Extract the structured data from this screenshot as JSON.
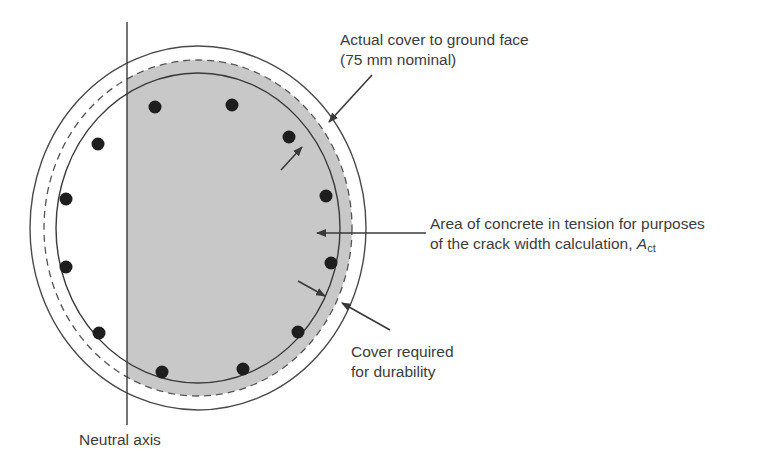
{
  "diagram": {
    "colors": {
      "background": "#ffffff",
      "line": "#4a4a4a",
      "shaded_tension_area": "#c8c8c8",
      "rebar": "#1e1e1e",
      "text": "#3c3c3c"
    },
    "geometry": {
      "center": {
        "x": 198,
        "y": 228
      },
      "outer_face": {
        "rx": 168,
        "ry": 182
      },
      "durability_cover_dashed": {
        "rx": 154,
        "ry": 168
      },
      "reinforcement_line": {
        "rx": 142,
        "ry": 155
      },
      "neutral_axis_x": 127,
      "neutral_axis_y_range": [
        22,
        425
      ]
    },
    "rebars": [
      {
        "x": 155,
        "y": 107
      },
      {
        "x": 232,
        "y": 105
      },
      {
        "x": 289,
        "y": 137
      },
      {
        "x": 326,
        "y": 196
      },
      {
        "x": 331,
        "y": 263
      },
      {
        "x": 298,
        "y": 332
      },
      {
        "x": 243,
        "y": 369
      },
      {
        "x": 162,
        "y": 372
      },
      {
        "x": 99,
        "y": 333
      },
      {
        "x": 66,
        "y": 267
      },
      {
        "x": 66,
        "y": 199
      },
      {
        "x": 98,
        "y": 144
      }
    ],
    "labels": {
      "actual_cover_line1": "Actual cover to ground face",
      "actual_cover_line2": "(75 mm nominal)",
      "tension_area_line1": "Area of concrete in tension for purposes",
      "tension_area_line2_prefix": "of the crack width calculation, ",
      "tension_area_symbol": "A",
      "tension_area_subscript": "ct",
      "durability_line1": "Cover required",
      "durability_line2": "for durability",
      "neutral_axis": "Neutral axis"
    }
  }
}
